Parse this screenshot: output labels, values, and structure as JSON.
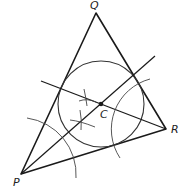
{
  "diagram": {
    "vertices": {
      "P": {
        "label": "P",
        "x": 21,
        "y": 174
      },
      "Q": {
        "label": "Q",
        "x": 96,
        "y": 13
      },
      "R": {
        "label": "R",
        "x": 166,
        "y": 129
      }
    },
    "center": {
      "label": "C",
      "x": 101,
      "y": 104
    },
    "incircle_radius": 43,
    "colors": {
      "stroke": "#1a1a1a",
      "construction": "#333333",
      "background": "#ffffff"
    }
  }
}
